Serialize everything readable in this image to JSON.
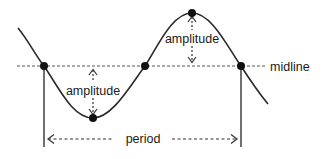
{
  "diagram": {
    "labels": {
      "midline": "midline",
      "period": "period",
      "amplitude_upper": "amplitude",
      "amplitude_lower": "amplitude"
    },
    "key_points": [
      {
        "name": "midline-crossing-1",
        "phase": "start of period"
      },
      {
        "name": "trough",
        "phase": "minimum"
      },
      {
        "name": "midline-crossing-2",
        "phase": "half period"
      },
      {
        "name": "peak",
        "phase": "maximum"
      },
      {
        "name": "midline-crossing-3",
        "phase": "end of period"
      }
    ],
    "colors": {
      "ink": "#2a2a2a",
      "background": "#ffffff"
    }
  }
}
